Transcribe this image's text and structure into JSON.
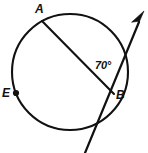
{
  "figure": {
    "type": "geometry-diagram",
    "background_color": "#ffffff",
    "stroke_color": "#111111"
  },
  "labels": {
    "point_a": "A",
    "point_b": "B",
    "point_e": "E",
    "angle": "70°"
  },
  "geometry": {
    "circle": {
      "cx": 70,
      "cy": 72,
      "r": 58
    },
    "points": {
      "A": {
        "x": 42,
        "y": 21
      },
      "B": {
        "x": 112,
        "y": 92
      },
      "E": {
        "x": 16,
        "y": 93
      }
    },
    "chord_ab": {
      "x1": 42,
      "y1": 21,
      "x2": 114,
      "y2": 94
    },
    "tangent_ray": {
      "x1": 85,
      "y1": 152,
      "x2": 143,
      "y2": 13
    },
    "angle_value": 70
  }
}
